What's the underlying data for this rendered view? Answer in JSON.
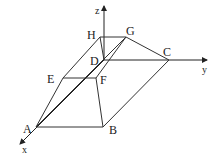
{
  "diagram": {
    "type": "3d-solid-frustum-with-axes",
    "axes": {
      "x": {
        "label": "x"
      },
      "y": {
        "label": "y"
      },
      "z": {
        "label": "z"
      }
    },
    "vertices": {
      "A": "A",
      "B": "B",
      "C": "C",
      "D": "D",
      "E": "E",
      "F": "F",
      "G": "G",
      "H": "H"
    },
    "edges": [
      "A-B",
      "B-C",
      "C-D",
      "D-A",
      "E-F",
      "F-G",
      "G-H",
      "H-E",
      "A-E",
      "B-F",
      "C-G",
      "D-H"
    ],
    "colors": {
      "stroke": "#333333",
      "background": "#ffffff"
    }
  }
}
